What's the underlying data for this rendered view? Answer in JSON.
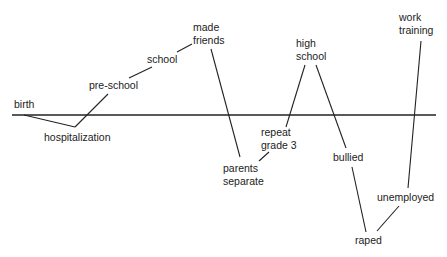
{
  "diagram": {
    "type": "life-course timeline",
    "baseline": {
      "y": 115,
      "x1": 12,
      "x2": 436
    },
    "line_color": "#222222",
    "events": [
      {
        "id": "birth",
        "label": "birth",
        "x": 14,
        "y": 98,
        "w": 40
      },
      {
        "id": "hospitalization",
        "label": "hospitalization",
        "x": 44,
        "y": 131,
        "w": 80
      },
      {
        "id": "pre-school",
        "label": "pre-school",
        "x": 89,
        "y": 79,
        "w": 60
      },
      {
        "id": "school",
        "label": "school",
        "x": 147,
        "y": 53,
        "w": 40
      },
      {
        "id": "made-friends",
        "label": "made\nfriends",
        "x": 193,
        "y": 21,
        "w": 40
      },
      {
        "id": "parents-separate",
        "label": "parents\nseparate",
        "x": 223,
        "y": 162,
        "w": 45
      },
      {
        "id": "repeat-grade-3",
        "label": "repeat\ngrade 3",
        "x": 261,
        "y": 126,
        "w": 45
      },
      {
        "id": "high-school",
        "label": "high\nschool",
        "x": 296,
        "y": 37,
        "w": 40
      },
      {
        "id": "bullied",
        "label": "bullied",
        "x": 333,
        "y": 151,
        "w": 40
      },
      {
        "id": "raped",
        "label": "raped",
        "x": 355,
        "y": 234,
        "w": 40
      },
      {
        "id": "unemployed",
        "label": "unemployed",
        "x": 377,
        "y": 191,
        "w": 60
      },
      {
        "id": "work-training",
        "label": "work\ntraining",
        "x": 399,
        "y": 11,
        "w": 45
      }
    ],
    "connectors": [
      {
        "from": "birth",
        "to": "hospitalization",
        "x1": 24,
        "y1": 115,
        "x2": 75,
        "y2": 127
      },
      {
        "from": "hospitalization",
        "to": "pre-school",
        "x1": 75,
        "y1": 127,
        "x2": 108,
        "y2": 94
      },
      {
        "from": "pre-school",
        "to": "school",
        "x1": 129,
        "y1": 78,
        "x2": 152,
        "y2": 67
      },
      {
        "from": "school",
        "to": "made-friends",
        "x1": 177,
        "y1": 52,
        "x2": 192,
        "y2": 44
      },
      {
        "from": "made-friends",
        "to": "parents-separate",
        "x1": 211,
        "y1": 49,
        "x2": 240,
        "y2": 157
      },
      {
        "from": "parents-separate",
        "to": "repeat-grade-3",
        "x1": 259,
        "y1": 161,
        "x2": 269,
        "y2": 152
      },
      {
        "from": "repeat-grade-3",
        "to": "high-school",
        "x1": 286,
        "y1": 127,
        "x2": 305,
        "y2": 65
      },
      {
        "from": "high-school",
        "to": "bullied",
        "x1": 316,
        "y1": 65,
        "x2": 346,
        "y2": 148
      },
      {
        "from": "bullied",
        "to": "raped",
        "x1": 352,
        "y1": 167,
        "x2": 366,
        "y2": 232
      },
      {
        "from": "raped",
        "to": "unemployed",
        "x1": 377,
        "y1": 231,
        "x2": 399,
        "y2": 206
      },
      {
        "from": "unemployed",
        "to": "work-training",
        "x1": 408,
        "y1": 188,
        "x2": 421,
        "y2": 41
      }
    ]
  }
}
